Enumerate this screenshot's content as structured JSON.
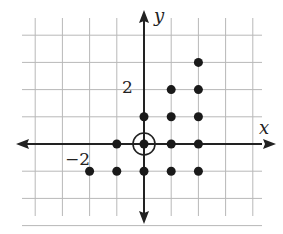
{
  "diagram": {
    "type": "coordinate-grid-lattice-points",
    "x_axis_label": "x",
    "y_axis_label": "y",
    "x_tick_label": "−2",
    "y_tick_label": "2",
    "x_range": [
      -4,
      4
    ],
    "y_range": [
      -3,
      4
    ],
    "origin_marker": "circle",
    "colors": {
      "grid": "#b8b8b8",
      "axis": "#222222",
      "point": "#1a1a1a"
    },
    "points": [
      {
        "x": 0,
        "y": 0,
        "circled": true
      },
      {
        "x": -1,
        "y": 0
      },
      {
        "x": 1,
        "y": 0
      },
      {
        "x": 2,
        "y": 0
      },
      {
        "x": 0,
        "y": 1
      },
      {
        "x": 1,
        "y": 1
      },
      {
        "x": 2,
        "y": 1
      },
      {
        "x": 1,
        "y": 2
      },
      {
        "x": 2,
        "y": 2
      },
      {
        "x": 2,
        "y": 3
      },
      {
        "x": -2,
        "y": -1
      },
      {
        "x": -1,
        "y": -1
      },
      {
        "x": 0,
        "y": -1
      },
      {
        "x": 1,
        "y": -1
      },
      {
        "x": 2,
        "y": -1
      }
    ]
  }
}
